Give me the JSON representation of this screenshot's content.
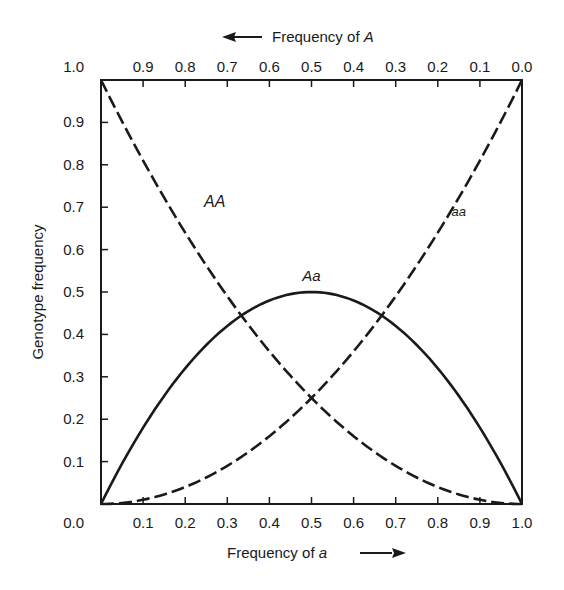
{
  "chart_data": {
    "type": "line",
    "title": "",
    "xlabel": "Frequency of a",
    "xlabel_prefix": "Frequency of ",
    "xlabel_var": "a",
    "x2label": "Frequency of A",
    "x2label_prefix": "Frequency of ",
    "x2label_var": "A",
    "ylabel": "Genotype frequency",
    "xlim": [
      0.0,
      1.0
    ],
    "ylim": [
      0.0,
      1.0
    ],
    "grid": false,
    "x_ticks": [
      "0.0",
      "0.1",
      "0.2",
      "0.3",
      "0.4",
      "0.5",
      "0.6",
      "0.7",
      "0.8",
      "0.9",
      "1.0"
    ],
    "x2_ticks": [
      "1.0",
      "0.9",
      "0.8",
      "0.7",
      "0.6",
      "0.5",
      "0.4",
      "0.3",
      "0.2",
      "0.1",
      "0.0"
    ],
    "y_ticks": [
      "0.0",
      "0.1",
      "0.2",
      "0.3",
      "0.4",
      "0.5",
      "0.6",
      "0.7",
      "0.8",
      "0.9",
      "1.0"
    ],
    "x": [
      0.0,
      0.1,
      0.2,
      0.3,
      0.4,
      0.5,
      0.6,
      0.7,
      0.8,
      0.9,
      1.0
    ],
    "series": [
      {
        "name": "AA",
        "style": "dashed",
        "formula": "(1-q)^2",
        "values": [
          1.0,
          0.81,
          0.64,
          0.49,
          0.36,
          0.25,
          0.16,
          0.09,
          0.04,
          0.01,
          0.0
        ],
        "label_pos": [
          0.27,
          0.7
        ]
      },
      {
        "name": "Aa",
        "style": "solid",
        "formula": "2q(1-q)",
        "values": [
          0.0,
          0.18,
          0.32,
          0.42,
          0.48,
          0.5,
          0.48,
          0.42,
          0.32,
          0.18,
          0.0
        ],
        "label_pos": [
          0.5,
          0.525
        ]
      },
      {
        "name": "aa",
        "style": "dashed",
        "formula": "q^2",
        "values": [
          0.0,
          0.01,
          0.04,
          0.09,
          0.16,
          0.25,
          0.36,
          0.49,
          0.64,
          0.81,
          1.0
        ],
        "label_pos": [
          0.85,
          0.68
        ]
      }
    ],
    "annotations": [
      {
        "text": "AA",
        "series": "AA"
      },
      {
        "text": "Aa",
        "series": "Aa"
      },
      {
        "text": "aa",
        "series": "aa"
      }
    ]
  }
}
